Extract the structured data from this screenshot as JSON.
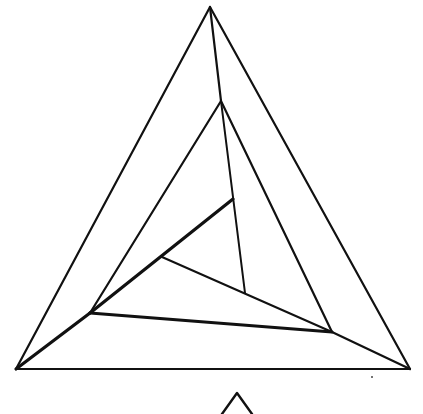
{
  "diagram": {
    "title": "",
    "stroke_color": "#111111",
    "background": "#ffffff",
    "segments": [
      {
        "name": "outer-left-edge",
        "x1": 210,
        "y1": 7,
        "x2": 16,
        "y2": 369,
        "w": 2.2
      },
      {
        "name": "outer-right-edge",
        "x1": 210,
        "y1": 7,
        "x2": 410,
        "y2": 369,
        "w": 2.2
      },
      {
        "name": "outer-base-edge",
        "x1": 16,
        "y1": 369,
        "x2": 410,
        "y2": 369,
        "w": 2.2
      },
      {
        "name": "spiral-apex-to-second",
        "x1": 210,
        "y1": 7,
        "x2": 221,
        "y2": 101,
        "w": 2.2
      },
      {
        "name": "second-left-edge",
        "x1": 221,
        "y1": 101,
        "x2": 90,
        "y2": 313,
        "w": 2.2
      },
      {
        "name": "second-right-edge",
        "x1": 221,
        "y1": 101,
        "x2": 332,
        "y2": 332,
        "w": 2.2
      },
      {
        "name": "second-to-outer-corner",
        "x1": 332,
        "y1": 332,
        "x2": 410,
        "y2": 369,
        "w": 2.2
      },
      {
        "name": "outer-corner-to-mid-left",
        "x1": 16,
        "y1": 369,
        "x2": 90,
        "y2": 313,
        "w": 3.2
      },
      {
        "name": "mid-base-thick",
        "x1": 90,
        "y1": 313,
        "x2": 332,
        "y2": 332,
        "w": 3.2
      },
      {
        "name": "mid-left-to-inner-apex",
        "x1": 90,
        "y1": 313,
        "x2": 233,
        "y2": 199,
        "w": 3.2
      },
      {
        "name": "inner-apex-drop",
        "x1": 221,
        "y1": 101,
        "x2": 245,
        "y2": 293,
        "w": 2
      },
      {
        "name": "inner-short-edge",
        "x1": 162,
        "y1": 257,
        "x2": 332,
        "y2": 332,
        "w": 2
      }
    ],
    "partial_shape": {
      "name": "partial-bottom-triangle",
      "apex": [
        237,
        393
      ],
      "left": [
        222,
        414
      ],
      "right": [
        252,
        414
      ]
    },
    "speck": {
      "cx": 372,
      "cy": 377,
      "r": 1
    }
  }
}
